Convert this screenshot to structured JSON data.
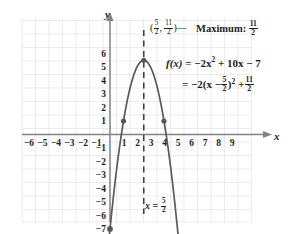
{
  "chart_data": {
    "type": "line",
    "title": "",
    "xlabel": "x",
    "ylabel": "y",
    "xlim": [
      -6.8,
      9.8
    ],
    "ylim": [
      -7.9,
      6.6
    ],
    "grid": true,
    "legend": "none",
    "x_ticks": [
      -6,
      -5,
      -4,
      -3,
      -2,
      -1,
      1,
      2,
      3,
      4,
      5,
      6,
      7,
      8,
      9
    ],
    "y_ticks": [
      6,
      5,
      4,
      3,
      2,
      1,
      -1,
      -2,
      -3,
      -4,
      -5,
      -6,
      -7
    ],
    "x_tick_labels": [
      "-6",
      "-5",
      "-4",
      "-3",
      "-2",
      "-1",
      "1",
      "2",
      "3",
      "4",
      "5",
      "6",
      "7",
      "8",
      "9"
    ],
    "y_tick_labels": [
      "6",
      "5",
      "4",
      "3",
      "2",
      "1",
      "-1",
      "-2",
      "-3",
      "-4",
      "-5",
      "-6",
      "-7"
    ],
    "series": [
      {
        "name": "f(x) = -2x^2 + 10x - 7",
        "kind": "parabola",
        "a": -2,
        "b": 10,
        "c": -7,
        "vertex": [
          2.5,
          5.5
        ],
        "x_domain": [
          -0.38,
          5.38
        ],
        "color": "#58595b",
        "opens": "down"
      }
    ],
    "points": [
      {
        "x": 2.5,
        "y": 5.5,
        "role": "vertex"
      },
      {
        "x": 1,
        "y": 1,
        "role": "curve-point"
      },
      {
        "x": 4,
        "y": 1,
        "role": "curve-point"
      },
      {
        "x": 0,
        "y": -7,
        "role": "y-intercept"
      }
    ],
    "axis_of_symmetry": {
      "x": 2.5,
      "style": "dashed"
    },
    "annotations": [
      {
        "id": "vertex",
        "text": "(5/2, 11/2)"
      },
      {
        "id": "maximum",
        "text": "Maximum: 11/2"
      },
      {
        "id": "equation_line_1",
        "text": "f(x) = -2x^2 + 10x - 7"
      },
      {
        "id": "equation_line_2",
        "text": "= -2(x - 5/2)^2 + 11/2"
      },
      {
        "id": "axis_of_symmetry",
        "text": "x = 5/2"
      }
    ]
  },
  "labels": {
    "y_axis": "y",
    "x_axis": "x",
    "maximum_word": "Maximum:",
    "fx": "f(x)",
    "equals": "=",
    "eq1_rest": "−2x",
    "eq1_tail": "+ 10x − 7",
    "eq2_lead": "−2(x −",
    "eq2_mid": ")",
    "eq2_tail": "+",
    "axis_sym_x": "x",
    "sep_dash": "—",
    "comma": ",",
    "paren_open": "(",
    "paren_close": ")",
    "five": "5",
    "two": "2",
    "eleven": "11",
    "exponent_two": "2"
  },
  "colors": {
    "curve": "#58595b",
    "grid": "#e3e3e6",
    "axis": "#808285",
    "text": "#231f20",
    "point": "#58595b",
    "background": "#ffffff"
  }
}
